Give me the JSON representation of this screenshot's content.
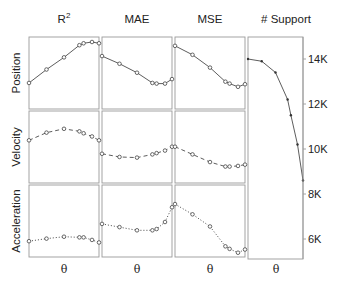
{
  "chart_data": {
    "type": "line",
    "layout": "small-multiples grid 3 rows x 4 columns (last column spans all rows)",
    "columns": [
      "R²",
      "MAE",
      "MSE",
      "# Support"
    ],
    "rows": [
      "Position",
      "Velocity",
      "Acceleration"
    ],
    "xlabel": "θ",
    "x": [
      0,
      0.25,
      0.5,
      0.72,
      0.78,
      0.9,
      1.0
    ],
    "x_ticks_visible": false,
    "line_styles": {
      "Position": "solid",
      "Velocity": "dashed",
      "Acceleration": "dotted"
    },
    "metric_panels": [
      {
        "row": "Position",
        "col": "R²",
        "y_norm": [
          0.36,
          0.57,
          0.76,
          0.95,
          0.98,
          1.0,
          0.98
        ]
      },
      {
        "row": "Position",
        "col": "MAE",
        "y_norm": [
          0.78,
          0.66,
          0.52,
          0.36,
          0.35,
          0.35,
          0.42
        ]
      },
      {
        "row": "Position",
        "col": "MSE",
        "y_norm": [
          0.94,
          0.8,
          0.6,
          0.38,
          0.35,
          0.3,
          0.34
        ]
      },
      {
        "row": "Velocity",
        "col": "R²",
        "y_norm": [
          0.62,
          0.74,
          0.8,
          0.76,
          0.73,
          0.68,
          0.62
        ]
      },
      {
        "row": "Velocity",
        "col": "MAE",
        "y_norm": [
          0.41,
          0.36,
          0.35,
          0.4,
          0.42,
          0.46,
          0.52
        ]
      },
      {
        "row": "Velocity",
        "col": "MSE",
        "y_norm": [
          0.52,
          0.4,
          0.28,
          0.21,
          0.21,
          0.22,
          0.24
        ]
      },
      {
        "row": "Acceleration",
        "col": "R²",
        "y_norm": [
          0.2,
          0.24,
          0.27,
          0.26,
          0.26,
          0.22,
          0.18
        ]
      },
      {
        "row": "Acceleration",
        "col": "MAE",
        "y_norm": [
          0.47,
          0.42,
          0.37,
          0.37,
          0.39,
          0.5,
          0.73
        ]
      },
      {
        "row": "Acceleration",
        "col": "MSE",
        "y_norm": [
          0.78,
          0.62,
          0.43,
          0.12,
          0.08,
          0.02,
          0.07
        ]
      }
    ],
    "support_panel": {
      "col": "# Support",
      "x": [
        0,
        0.25,
        0.5,
        0.72,
        0.78,
        0.9,
        1.0
      ],
      "values": [
        14000,
        13900,
        13400,
        12200,
        11500,
        10200,
        8600
      ],
      "ylim": [
        5100,
        15000
      ],
      "yticks": [
        14000,
        12000,
        10000,
        8000,
        6000
      ],
      "ytick_labels": [
        "14K",
        "12K",
        "10K",
        "8K",
        "6K"
      ],
      "axis_position": "right"
    },
    "grid": false,
    "legend": null,
    "marker": "open circle"
  },
  "figure": {
    "column_titles": {
      "r2_base": "R",
      "r2_sup": "2",
      "mae": "MAE",
      "mse": "MSE",
      "support": "# Support"
    },
    "row_titles": [
      "Position",
      "Velocity",
      "Acceleration"
    ],
    "x_axis_labels": [
      "θ",
      "θ",
      "θ",
      "θ"
    ],
    "support_ticks": [
      "14K",
      "12K",
      "10K",
      "8K",
      "6K"
    ],
    "colors": {
      "frame": "#9a9a9a",
      "line": "#333333",
      "marker": "#444444",
      "text": "#222222"
    }
  }
}
